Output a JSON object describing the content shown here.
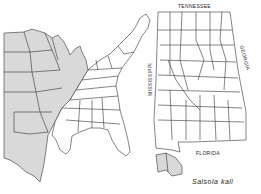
{
  "species_name": "Salsola kali",
  "labels": {
    "tennessee": "TENNESSEE",
    "georgia": "GEORGIA",
    "mississippi": "MISSISSIPPI",
    "florida": "FLORIDA"
  },
  "colors": {
    "shaded": "#d9d9d9",
    "unshaded": "#ffffff",
    "line": "#333333"
  },
  "legend": {
    "shaded_meaning": "range / occurrence"
  }
}
